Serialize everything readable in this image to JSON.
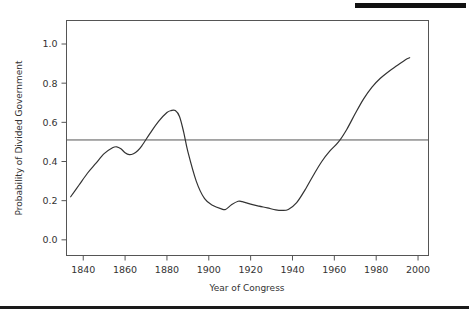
{
  "figure": {
    "top_rule_present": true,
    "bottom_rule_present": true
  },
  "chart_data": {
    "type": "line",
    "title": "",
    "xlabel": "Year of Congress",
    "ylabel": "Probability of Divided Government",
    "xlim": [
      1832,
      2005
    ],
    "ylim": [
      -0.08,
      1.12
    ],
    "xticks": [
      1840,
      1860,
      1880,
      1900,
      1920,
      1940,
      1960,
      1980,
      2000
    ],
    "xtick_labels": [
      "1840",
      "1860",
      "1880",
      "1900",
      "1920",
      "1940",
      "1960",
      "1980",
      "2000"
    ],
    "yticks": [
      0.0,
      0.2,
      0.4,
      0.6,
      0.8,
      1.0
    ],
    "ytick_labels": [
      "0.0",
      "0.2",
      "0.4",
      "0.6",
      "0.8",
      "1.0"
    ],
    "grid": false,
    "legend": null,
    "line_color": "#333333",
    "reference_line": {
      "orientation": "horizontal",
      "value": 0.51,
      "color": "#555555",
      "label": ""
    },
    "series": [
      {
        "name": "Probability of Divided Government",
        "x": [
          1834,
          1838,
          1842,
          1846,
          1850,
          1854,
          1856,
          1858,
          1860,
          1862,
          1864,
          1866,
          1868,
          1872,
          1876,
          1880,
          1882,
          1884,
          1886,
          1888,
          1890,
          1894,
          1898,
          1902,
          1906,
          1908,
          1911,
          1914,
          1916,
          1920,
          1924,
          1928,
          1932,
          1935,
          1938,
          1942,
          1946,
          1950,
          1954,
          1958,
          1962,
          1966,
          1970,
          1974,
          1978,
          1982,
          1986,
          1990,
          1994,
          1996
        ],
        "y": [
          0.22,
          0.28,
          0.34,
          0.39,
          0.44,
          0.47,
          0.475,
          0.465,
          0.445,
          0.435,
          0.44,
          0.455,
          0.48,
          0.545,
          0.605,
          0.65,
          0.66,
          0.66,
          0.63,
          0.55,
          0.45,
          0.3,
          0.21,
          0.175,
          0.158,
          0.155,
          0.18,
          0.197,
          0.195,
          0.182,
          0.172,
          0.163,
          0.153,
          0.15,
          0.155,
          0.19,
          0.255,
          0.33,
          0.4,
          0.455,
          0.5,
          0.565,
          0.645,
          0.72,
          0.78,
          0.825,
          0.86,
          0.89,
          0.92,
          0.93
        ]
      }
    ]
  }
}
